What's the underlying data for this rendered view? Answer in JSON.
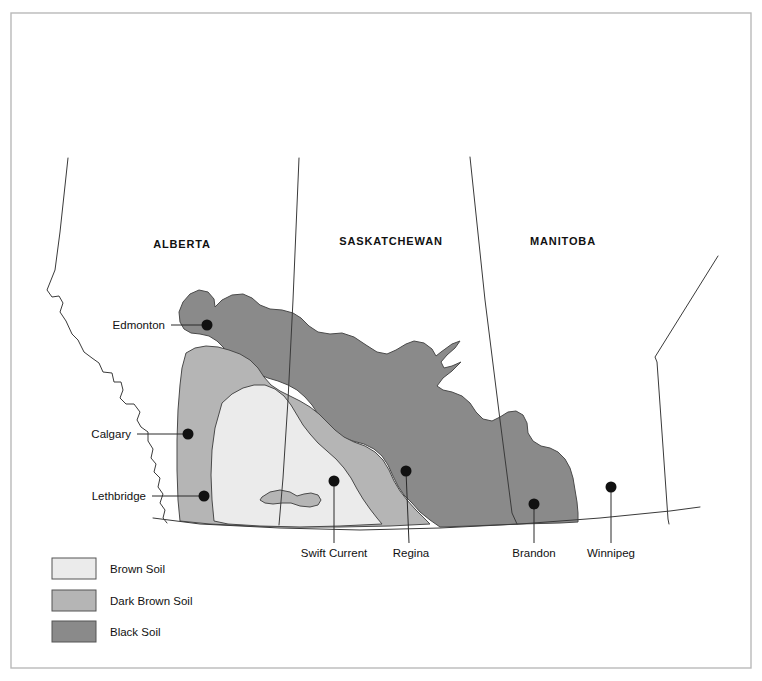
{
  "figure": {
    "kind": "thematic-map",
    "region": "Canadian Prairies"
  },
  "colors": {
    "brown_soil": "#ebebeb",
    "dark_brown_soil": "#b5b5b5",
    "black_soil": "#8a8a8a",
    "outline": "#4a4a4a",
    "border_line": "#3a3a3a",
    "frame": "#b9b9b9",
    "text": "#111111",
    "background": "#ffffff"
  },
  "provinces": [
    {
      "id": "alberta",
      "label": "ALBERTA",
      "x": 182,
      "y": 248
    },
    {
      "id": "saskatchewan",
      "label": "SASKATCHEWAN",
      "x": 391,
      "y": 245
    },
    {
      "id": "manitoba",
      "label": "MANITOBA",
      "x": 563,
      "y": 245
    }
  ],
  "cities": [
    {
      "id": "edmonton",
      "label": "Edmonton",
      "dot_x": 207,
      "dot_y": 325,
      "label_x": 165,
      "label_y": 329,
      "leader": "M171,325 L207,325",
      "label_style": "city-label-right"
    },
    {
      "id": "calgary",
      "label": "Calgary",
      "dot_x": 188,
      "dot_y": 434,
      "label_x": 131,
      "label_y": 438,
      "leader": "M137,434 L188,434",
      "label_style": "city-label-right"
    },
    {
      "id": "lethbridge",
      "label": "Lethbridge",
      "dot_x": 204,
      "dot_y": 496,
      "label_x": 146,
      "label_y": 500,
      "leader": "M152,496 L204,496",
      "label_style": "city-label-right"
    },
    {
      "id": "swift-current",
      "label": "Swift Current",
      "dot_x": 334,
      "dot_y": 481,
      "label_x": 334,
      "label_y": 557,
      "leader": "M334,481 L334,543",
      "label_style": "city-label-center"
    },
    {
      "id": "regina",
      "label": "Regina",
      "dot_x": 406,
      "dot_y": 471,
      "label_x": 411,
      "label_y": 557,
      "leader": "M406,471 L409,543",
      "label_style": "city-label-center"
    },
    {
      "id": "brandon",
      "label": "Brandon",
      "dot_x": 534,
      "dot_y": 504,
      "label_x": 534,
      "label_y": 557,
      "leader": "M534,504 L534,543",
      "label_style": "city-label-center"
    },
    {
      "id": "winnipeg",
      "label": "Winnipeg",
      "dot_x": 611,
      "dot_y": 487,
      "label_x": 611,
      "label_y": 557,
      "leader": "M611,487 L611,543",
      "label_style": "city-label-center"
    }
  ],
  "legend": {
    "items": [
      {
        "id": "brown-soil",
        "label": "Brown Soil",
        "color": "#ebebeb",
        "x": 52,
        "y": 558,
        "w": 44,
        "h": 21,
        "label_x": 110,
        "label_y": 573
      },
      {
        "id": "dark-brown-soil",
        "label": "Dark Brown Soil",
        "color": "#b5b5b5",
        "x": 52,
        "y": 590,
        "w": 44,
        "h": 21,
        "label_x": 110,
        "label_y": 605
      },
      {
        "id": "black-soil",
        "label": "Black Soil",
        "color": "#8a8a8a",
        "x": 52,
        "y": 621,
        "w": 44,
        "h": 21,
        "label_x": 110,
        "label_y": 636
      }
    ]
  },
  "geometry": {
    "page_frame": {
      "x": 11,
      "y": 13,
      "w": 740,
      "h": 655
    },
    "bc_alberta_border": "M68,158 L60,232 L55,270 L47,290 L52,297 L59,296 L63,303 L60,312 L66,321 L72,334 L78,340 L84,352 L92,358 L99,363 L103,372 L112,373 L114,382 L121,382 L123,390 L120,398 L126,404 L134,404 L140,412 L137,420 L141,427 L148,432 L148,441 L153,449 L151,458 L156,464 L154,472 L160,478 L158,487 L163,494 L160,503 L165,510 L163,518 L167,523",
    "alberta_sask_border": "M299,158 L293,300 L288,400 L283,478 L279,525",
    "sask_manitoba_border": "M470,157 L485,300 L500,420 L512,513 L517,524",
    "manitoba_ontario_border": "M718,256 L655,357 L657,362 L663,447 L668,519 L669,524",
    "usa_border": "M153,518 L200,524 L280,528 L360,530 L440,528 L520,524 L600,518 L670,511 L700,507",
    "black_soil": "M183,302 L190,294 L199,290 L208,292 L214,299 L215,307 L222,300 L232,295 L243,294 L252,298 L260,305 L270,309 L282,310 L293,313 L301,318 L309,326 L318,332 L330,334 L342,333 L354,337 L366,345 L377,352 L387,354 L396,350 L406,344 L414,341 L424,343 L432,349 L436,356 L441,352 L452,344 L460,341 L455,348 L447,355 L441,362 L444,368 L452,366 L461,362 L452,371 L443,378 L437,386 L443,390 L452,392 L462,396 L470,403 L476,412 L483,419 L492,421 L500,417 L508,412 L516,411 L523,415 L527,423 L528,433 L533,441 L541,446 L550,448 L558,452 L565,459 L570,468 L573,478 L575,490 L577,502 L578,513 L578,522 L560,523 L520,524 L470,526 L440,527 L430,520 L420,512 L412,503 L404,495 L398,486 L393,476 L388,465 L382,456 L374,449 L364,444 L353,441 L342,437 L332,431 L324,423 L318,414 L312,405 L305,397 L297,390 L288,385 L278,381 L268,378 L258,374 L248,369 L239,363 L231,356 L224,348 L217,341 L209,336 L200,334 L191,333 L184,329 L180,322 L179,312 Z",
    "black_soil_notch": "M436,356 L441,352 L452,344 L460,341 L455,348 L447,355 L441,362 L444,368 L452,366 L461,362 L452,371 L443,378 L437,386 L430,380 L427,372 L429,363 Z",
    "dark_brown_soil": "M186,353 L195,348 L206,346 L218,347 L229,350 L240,354 L250,360 L258,368 L264,377 L271,385 L280,391 L290,396 L300,401 L310,407 L319,414 L327,422 L335,430 L344,437 L354,442 L365,446 L375,452 L383,460 L389,470 L394,481 L400,491 L407,500 L415,509 L423,517 L430,524 L390,526 L340,527 L290,527 L250,526 L210,524 L180,521 L178,500 L177,470 L177,440 L178,410 L180,385 L182,368 Z",
    "brown_soil": "M222,403 L232,394 L243,388 L254,385 L265,385 L275,389 L284,396 L291,405 L297,415 L303,425 L310,434 L318,443 L327,451 L336,459 L344,468 L351,478 L357,489 L363,499 L370,509 L377,518 L382,524 L340,526 L300,527 L260,526 L228,524 L214,521 L212,500 L211,475 L212,450 L215,428 Z",
    "dark_brown_island": "M262,497 L270,492 L280,490 L290,492 L297,496 L304,494 L311,493 L318,495 L321,500 L318,505 L310,507 L300,506 L291,503 L282,503 L273,504 L265,503 L260,500 Z"
  }
}
